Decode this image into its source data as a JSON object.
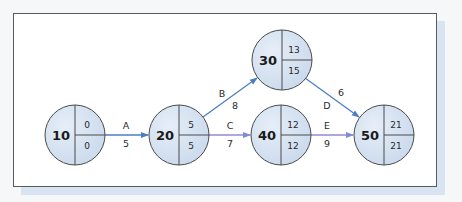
{
  "diagram": {
    "type": "activity-on-arrow network",
    "colors": {
      "node_fill": "#d6e3f1",
      "node_stroke": "#4a4a4a",
      "edge_blue": "#4a7fc8",
      "edge_purple": "#9a86d8",
      "frame_border": "#5a5a5a",
      "shadow": "#d8e4f2"
    },
    "nodes": [
      {
        "id": "10",
        "top": "0",
        "bottom": "0"
      },
      {
        "id": "20",
        "top": "5",
        "bottom": "5"
      },
      {
        "id": "30",
        "top": "13",
        "bottom": "15"
      },
      {
        "id": "40",
        "top": "12",
        "bottom": "12"
      },
      {
        "id": "50",
        "top": "21",
        "bottom": "21"
      }
    ],
    "edges": [
      {
        "from": "10",
        "to": "20",
        "activity": "A",
        "duration": "5"
      },
      {
        "from": "20",
        "to": "30",
        "activity": "B",
        "duration": "8"
      },
      {
        "from": "20",
        "to": "40",
        "activity": "C",
        "duration": "7"
      },
      {
        "from": "30",
        "to": "50",
        "activity": "D",
        "duration": "6"
      },
      {
        "from": "40",
        "to": "50",
        "activity": "E",
        "duration": "9"
      }
    ]
  }
}
